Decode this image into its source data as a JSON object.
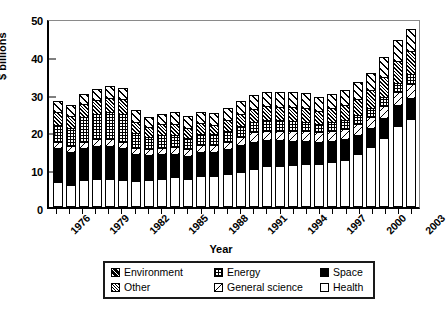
{
  "chart_data": {
    "type": "bar",
    "stacked": true,
    "title": "",
    "xlabel": "Year",
    "ylabel": "$ billions",
    "ylim": [
      0,
      50
    ],
    "yticks": [
      0,
      10,
      20,
      30,
      40,
      50
    ],
    "grid": false,
    "legend_position": "bottom",
    "categories": [
      "1976",
      "1977",
      "1978",
      "1979",
      "1980",
      "1981",
      "1982",
      "1983",
      "1984",
      "1985",
      "1986",
      "1987",
      "1988",
      "1989",
      "1990",
      "1991",
      "1992",
      "1993",
      "1994",
      "1995",
      "1996",
      "1997",
      "1998",
      "1999",
      "2000",
      "2001",
      "2002",
      "2003"
    ],
    "xtick_labels": [
      "1976",
      "1979",
      "1982",
      "1985",
      "1988",
      "1991",
      "1994",
      "1997",
      "2000",
      "2003"
    ],
    "series": [
      {
        "name": "Health",
        "pattern": "solid-white",
        "values": [
          6.0,
          5.4,
          6.6,
          6.8,
          6.8,
          6.5,
          6.3,
          6.6,
          7.0,
          7.4,
          7.0,
          7.6,
          7.8,
          8.2,
          8.8,
          9.6,
          10.2,
          10.4,
          10.6,
          10.8,
          10.8,
          11.4,
          12.0,
          13.4,
          15.4,
          17.8,
          21.0,
          22.8
        ]
      },
      {
        "name": "Space",
        "pattern": "solid-black",
        "values": [
          9.0,
          8.6,
          8.4,
          8.8,
          8.8,
          8.6,
          7.2,
          6.6,
          6.6,
          6.2,
          6.0,
          6.4,
          6.2,
          6.6,
          7.0,
          7.2,
          7.0,
          6.8,
          6.4,
          6.2,
          5.8,
          5.6,
          5.4,
          5.2,
          5.0,
          5.2,
          5.4,
          5.6
        ]
      },
      {
        "name": "General science",
        "pattern": "diagonal-line",
        "values": [
          1.6,
          1.6,
          1.8,
          1.8,
          1.8,
          1.7,
          1.5,
          1.5,
          1.6,
          1.7,
          1.7,
          1.8,
          1.9,
          2.0,
          2.2,
          2.4,
          2.5,
          2.5,
          2.6,
          2.6,
          2.6,
          2.7,
          2.8,
          2.9,
          3.0,
          3.2,
          3.4,
          3.6
        ]
      },
      {
        "name": "Energy",
        "pattern": "grid",
        "values": [
          4.6,
          4.8,
          6.4,
          6.8,
          7.2,
          7.4,
          4.0,
          3.4,
          3.4,
          3.2,
          3.0,
          3.0,
          2.8,
          2.8,
          2.8,
          2.8,
          2.8,
          2.7,
          2.6,
          2.4,
          2.2,
          2.2,
          2.2,
          2.2,
          2.2,
          2.4,
          2.4,
          2.6
        ]
      },
      {
        "name": "Other",
        "pattern": "dense-hatch",
        "values": [
          3.4,
          3.2,
          3.4,
          3.6,
          3.8,
          3.8,
          3.0,
          2.6,
          2.8,
          3.0,
          2.8,
          2.8,
          2.6,
          3.0,
          3.2,
          3.4,
          3.6,
          3.6,
          3.8,
          3.8,
          3.6,
          3.8,
          4.0,
          4.4,
          4.8,
          5.4,
          5.8,
          6.2
        ]
      },
      {
        "name": "Environment",
        "pattern": "wide-diagonal",
        "values": [
          2.8,
          2.8,
          2.8,
          3.0,
          3.0,
          3.0,
          3.2,
          2.6,
          2.8,
          3.0,
          3.0,
          3.0,
          3.0,
          3.2,
          3.4,
          3.6,
          3.8,
          3.8,
          3.8,
          3.8,
          3.6,
          3.8,
          4.0,
          4.4,
          4.6,
          5.2,
          5.6,
          5.8
        ]
      }
    ],
    "totals": [
      27.4,
      26.4,
      29.4,
      30.8,
      31.4,
      31.0,
      25.2,
      23.3,
      24.2,
      24.5,
      23.5,
      24.6,
      24.3,
      25.8,
      27.4,
      29.0,
      29.9,
      29.8,
      29.8,
      29.6,
      28.6,
      29.5,
      30.4,
      32.5,
      35.0,
      39.2,
      43.6,
      46.6
    ]
  },
  "axes": {
    "ylabel": "$ billions",
    "xlabel": "Year",
    "ytick_labels": [
      "0",
      "10",
      "20",
      "30",
      "40",
      "50"
    ],
    "xtick_labels": [
      "1976",
      "1979",
      "1982",
      "1985",
      "1988",
      "1991",
      "1994",
      "1997",
      "2000",
      "2003"
    ]
  },
  "legend": {
    "items": [
      {
        "label": "Environment",
        "swatch": "environment-hatch-swatch"
      },
      {
        "label": "Energy",
        "swatch": "energy-grid-swatch"
      },
      {
        "label": "Space",
        "swatch": "space-solid-swatch"
      },
      {
        "label": "Other",
        "swatch": "other-hatch-swatch"
      },
      {
        "label": "General science",
        "swatch": "general-science-diagonal-swatch"
      },
      {
        "label": "Health",
        "swatch": "health-white-swatch"
      }
    ]
  }
}
